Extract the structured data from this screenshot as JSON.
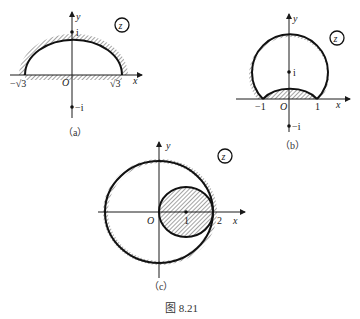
{
  "figure": {
    "caption": "图 8.21",
    "panels": [
      {
        "id": "a",
        "label": "（a）",
        "plane_label": "z",
        "axis_x": "x",
        "axis_y": "y",
        "origin": "O",
        "points": {
          "i": "i",
          "neg_i": "−i"
        },
        "ticks": {
          "left": "−√3",
          "right": "√3"
        },
        "description": "Upper half region bounded by circular arc through ±√3 and the real axis (hatched exterior)"
      },
      {
        "id": "b",
        "label": "（b）",
        "plane_label": "z",
        "axis_x": "x",
        "axis_y": "y",
        "origin": "O",
        "points": {
          "i": "i",
          "neg_i": "−i"
        },
        "ticks": {
          "left": "−1",
          "right": "1"
        },
        "description": "Region between large arc and small arc both through ±1"
      },
      {
        "id": "c",
        "label": "（c）",
        "plane_label": "z",
        "axis_x": "x",
        "axis_y": "y",
        "origin": "O",
        "ticks": {
          "one": "1",
          "two": "2"
        },
        "description": "Disk |z|<2 minus disk |z−1|<1 (hatched inner disk excluded)"
      }
    ]
  }
}
